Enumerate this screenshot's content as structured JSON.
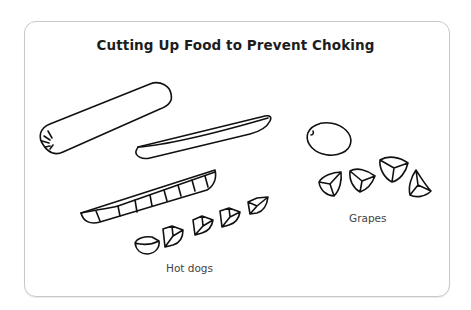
{
  "diagram": {
    "title": "Cutting Up Food to Prevent Choking",
    "groups": [
      {
        "label": "Hot dogs",
        "items": [
          "whole hot dog",
          "hot dog cut lengthwise",
          "lengthwise half sliced into pieces",
          "5 bite-size pieces"
        ]
      },
      {
        "label": "Grapes",
        "items": [
          "whole grape",
          "4 grape quarters"
        ]
      }
    ]
  }
}
